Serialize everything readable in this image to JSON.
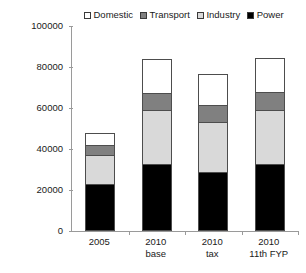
{
  "chart_data": {
    "type": "bar",
    "subtype": "stacked-column",
    "title": "",
    "xlabel": "",
    "ylabel": "Energy (PJ)",
    "ylim": [
      0,
      100000
    ],
    "ytick_step": 20000,
    "ytick_labels": [
      "100000",
      "80000",
      "60000",
      "40000",
      "20000",
      "0"
    ],
    "ytick_values": [
      100000,
      80000,
      60000,
      40000,
      20000,
      0
    ],
    "grid": false,
    "legend_position": "top",
    "categories": [
      "2005",
      "2010 base",
      "2010 tax",
      "2010 11th FYP"
    ],
    "category_lines": [
      {
        "line1": "2005",
        "line2": ""
      },
      {
        "line1": "2010",
        "line2": "base"
      },
      {
        "line1": "2010",
        "line2": "tax"
      },
      {
        "line1": "2010",
        "line2": "11th FYP"
      }
    ],
    "stack_order_bottom_to_top": [
      "Power",
      "Industry",
      "Transport",
      "Domestic"
    ],
    "series": [
      {
        "name": "Domestic",
        "color": "#ffffff",
        "values": [
          5900,
          16600,
          15100,
          16600
        ]
      },
      {
        "name": "Transport",
        "color": "#808080",
        "values": [
          4900,
          8300,
          8300,
          8800
        ]
      },
      {
        "name": "Industry",
        "color": "#d9d9d9",
        "values": [
          14100,
          26300,
          24400,
          26300
        ]
      },
      {
        "name": "Power",
        "color": "#000000",
        "values": [
          22900,
          32700,
          28800,
          32700
        ]
      }
    ],
    "totals": [
      47800,
      83900,
      76600,
      84400
    ]
  },
  "legend": {
    "items": [
      {
        "label": "Domestic",
        "color": "#ffffff"
      },
      {
        "label": "Transport",
        "color": "#808080"
      },
      {
        "label": "Industry",
        "color": "#d9d9d9"
      },
      {
        "label": "Power",
        "color": "#000000"
      }
    ]
  },
  "axis": {
    "y_title": "Energy (PJ)"
  },
  "colors": {
    "axis": "#9a9a9a",
    "segment_border": "#4d4d4d",
    "text": "#1a1a1a",
    "background": "#ffffff"
  }
}
